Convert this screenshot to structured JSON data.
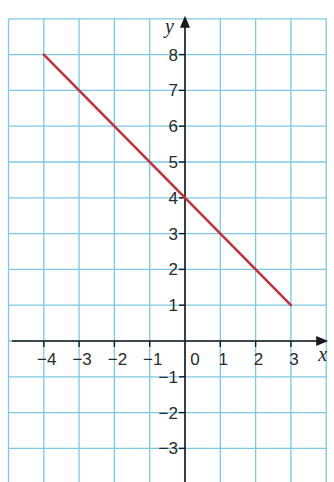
{
  "chart_data": {
    "type": "line",
    "title": "",
    "xlabel": "x",
    "ylabel": "y",
    "xlim": [
      -5,
      4
    ],
    "ylim": [
      -4,
      9
    ],
    "grid": true,
    "x_ticks": [
      -4,
      -3,
      -2,
      -1,
      0,
      1,
      2,
      3
    ],
    "x_tick_labels": [
      "−4",
      "−3",
      "−2",
      "−1",
      "0",
      "1",
      "2",
      "3"
    ],
    "y_ticks": [
      8,
      7,
      6,
      5,
      4,
      3,
      2,
      1,
      -1,
      -2,
      -3
    ],
    "y_tick_labels": [
      "8",
      "7",
      "6",
      "5",
      "4",
      "3",
      "2",
      "1",
      "−1",
      "−2",
      "−3"
    ],
    "series": [
      {
        "name": "y = -x + 4",
        "color": "#c0343f",
        "x": [
          -4,
          3
        ],
        "y": [
          8,
          1
        ]
      }
    ],
    "colors": {
      "grid": "#7ec8e3",
      "axis": "#1a1a1a",
      "line": "#c0343f"
    }
  }
}
